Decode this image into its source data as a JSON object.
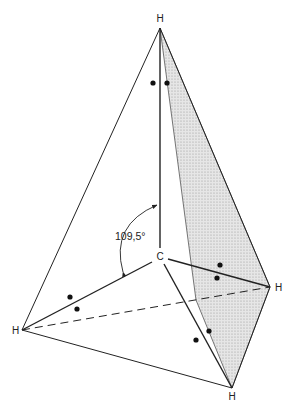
{
  "figure": {
    "center_atom": "C",
    "outer_atoms": [
      {
        "id": "top",
        "label": "H"
      },
      {
        "id": "right",
        "label": "H"
      },
      {
        "id": "left",
        "label": "H"
      },
      {
        "id": "bottom",
        "label": "H"
      }
    ],
    "bond_angle_label": "109,5°",
    "colors": {
      "line": "#222222",
      "shaded_face": "#d9d9d9",
      "electron_dot": "#111111"
    },
    "electron_pairs": 4
  }
}
